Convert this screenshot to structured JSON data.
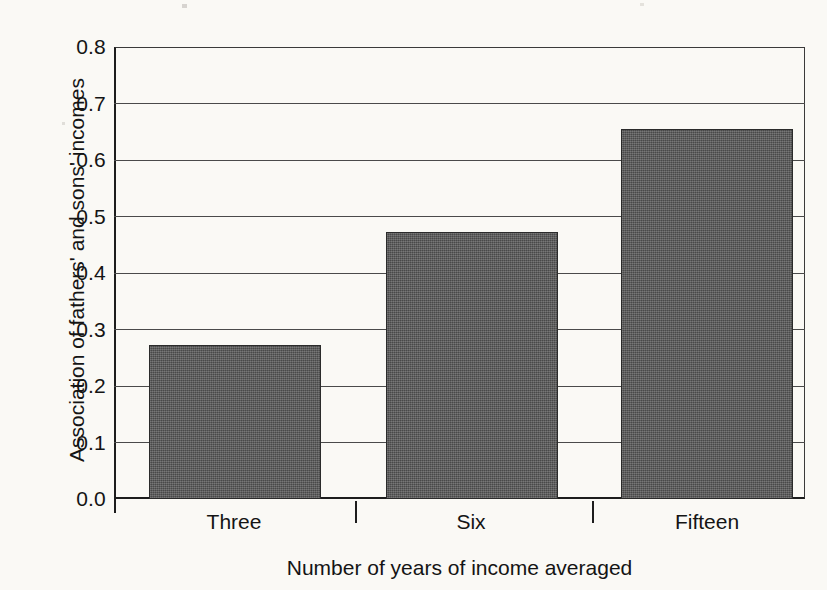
{
  "chart_data": {
    "type": "bar",
    "title": "",
    "categories": [
      "Three",
      "Six",
      "Fifteen"
    ],
    "values": [
      0.273,
      0.472,
      0.655
    ],
    "xlabel": "Number of years of income averaged",
    "ylabel": "Association of fathers' and sons' incomes",
    "ylim": [
      0.0,
      0.8
    ],
    "ytick_labels": [
      "0.0",
      "0.1",
      "0.2",
      "0.3",
      "0.4",
      "0.5",
      "0.6",
      "0.7",
      "0.8"
    ],
    "ytick_values": [
      0.0,
      0.1,
      0.2,
      0.3,
      0.4,
      0.5,
      0.6,
      0.7,
      0.8
    ],
    "grid": true,
    "legend": "none",
    "bar_color": "#595959",
    "bar_edge_color": "#2b2b2b",
    "background_color": "#faf9f5",
    "axis_color": "#1d1d1d"
  }
}
